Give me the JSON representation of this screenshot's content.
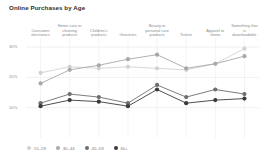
{
  "chart_data": {
    "type": "line",
    "title": "Online Purchases by Age",
    "xlabel": "",
    "ylabel": "",
    "ylim": [
      0,
      33
    ],
    "yticks": [
      10,
      20,
      30
    ],
    "ytick_labels": [
      "10%",
      "20%",
      "30%"
    ],
    "grid": true,
    "legend_position": "bottom-left",
    "categories": [
      "Consumer electronics",
      "Home care or cleaning products",
      "Children's products",
      "Groceries",
      "Beauty or personal care products",
      "Tickets",
      "Apparel or shoes",
      "Something that is downloadable"
    ],
    "series": [
      {
        "name": "15–29",
        "color": "#d2d2d2",
        "values": [
          21.5,
          23.5,
          23.0,
          23.5,
          23.0,
          22.5,
          24.5,
          29.5
        ]
      },
      {
        "name": "30–44",
        "color": "#a8a8a8",
        "values": [
          18.0,
          22.5,
          24.0,
          26.0,
          27.5,
          23.0,
          24.5,
          27.0
        ]
      },
      {
        "name": "45–59",
        "color": "#6e6e6e",
        "values": [
          11.5,
          14.5,
          13.5,
          11.5,
          17.5,
          13.5,
          16.0,
          14.5
        ]
      },
      {
        "name": "60+",
        "color": "#3b3b3b",
        "values": [
          10.5,
          12.5,
          12.0,
          10.5,
          16.0,
          11.5,
          12.5,
          13.0
        ]
      }
    ]
  },
  "legend": {
    "items": [
      {
        "label": "15–29",
        "color": "#d2d2d2"
      },
      {
        "label": "30–44",
        "color": "#a8a8a8"
      },
      {
        "label": "45–59",
        "color": "#6e6e6e"
      },
      {
        "label": "60+",
        "color": "#3b3b3b"
      }
    ]
  }
}
